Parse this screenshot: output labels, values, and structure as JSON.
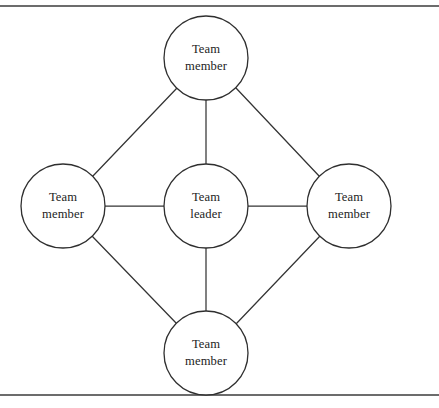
{
  "figure": {
    "background_color": "#ffffff",
    "width": 439,
    "height": 408,
    "rules": {
      "stroke_color": "#3b3b3b",
      "top_y": 6,
      "bottom_y": 395
    },
    "edge_style": {
      "stroke_color": "#343434",
      "stroke_width": 1.25
    },
    "node_style": {
      "fill_color": "#ffffff",
      "stroke_color": "#2f2f2f",
      "radius": 42
    }
  },
  "nodes": [
    {
      "id": "top",
      "role": "member",
      "line1": "Team",
      "line2": "member",
      "cx": 206,
      "cy": 58,
      "r": 42
    },
    {
      "id": "left",
      "role": "member",
      "line1": "Team",
      "line2": "member",
      "cx": 63,
      "cy": 206,
      "r": 42
    },
    {
      "id": "center",
      "role": "leader",
      "line1": "Team",
      "line2": "leader",
      "cx": 206,
      "cy": 206,
      "r": 42
    },
    {
      "id": "right",
      "role": "member",
      "line1": "Team",
      "line2": "member",
      "cx": 349,
      "cy": 206,
      "r": 42
    },
    {
      "id": "bottom",
      "role": "member",
      "line1": "Team",
      "line2": "member",
      "cx": 206,
      "cy": 353,
      "r": 42
    }
  ],
  "edges": [
    {
      "id": "center-top",
      "from": "center",
      "to": "top",
      "x1": 206,
      "y1": 164,
      "x2": 206,
      "y2": 100
    },
    {
      "id": "center-left",
      "from": "center",
      "to": "left",
      "x1": 164,
      "y1": 206,
      "x2": 105,
      "y2": 206
    },
    {
      "id": "center-right",
      "from": "center",
      "to": "right",
      "x1": 248,
      "y1": 206,
      "x2": 307,
      "y2": 206
    },
    {
      "id": "center-bottom",
      "from": "center",
      "to": "bottom",
      "x1": 206,
      "y1": 248,
      "x2": 206,
      "y2": 311
    },
    {
      "id": "top-left",
      "from": "top",
      "to": "left",
      "x1": 177,
      "y1": 88,
      "x2": 92,
      "y2": 177
    },
    {
      "id": "top-right",
      "from": "top",
      "to": "right",
      "x1": 236,
      "y1": 88,
      "x2": 320,
      "y2": 177
    },
    {
      "id": "left-bottom",
      "from": "left",
      "to": "bottom",
      "x1": 92,
      "y1": 236,
      "x2": 177,
      "y2": 324
    },
    {
      "id": "right-bottom",
      "from": "right",
      "to": "bottom",
      "x1": 320,
      "y1": 236,
      "x2": 236,
      "y2": 324
    }
  ]
}
